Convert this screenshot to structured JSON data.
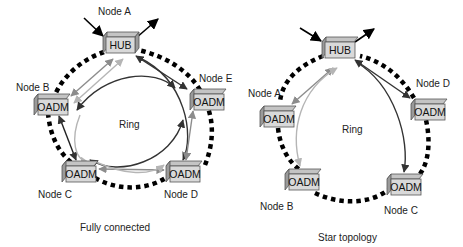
{
  "diagrams": [
    {
      "caption": "Fully connected",
      "ring_label": "Ring",
      "hub": {
        "box": "HUB",
        "node": "Node A"
      },
      "nodes": [
        {
          "id": "B",
          "label": "Node B",
          "box": "OADM"
        },
        {
          "id": "E",
          "label": "Node E",
          "box": "OADM"
        },
        {
          "id": "C",
          "label": "Node C",
          "box": "OADM"
        },
        {
          "id": "D",
          "label": "Node D",
          "box": "OADM"
        }
      ]
    },
    {
      "caption": "Star topology",
      "ring_label": "Ring",
      "hub": {
        "box": "HUB"
      },
      "nodes": [
        {
          "id": "A",
          "label": "Node A",
          "box": "OADM"
        },
        {
          "id": "D",
          "label": "Node D",
          "box": "OADM"
        },
        {
          "id": "B",
          "label": "Node B",
          "box": "OADM"
        },
        {
          "id": "C",
          "label": "Node C",
          "box": "OADM"
        }
      ]
    }
  ],
  "colors": {
    "ring_dots": "#000000",
    "box_face": "#d9d9d9",
    "box_top": "#c4c4c4",
    "box_side": "#9a9a9a",
    "arrow_dark": "#333333",
    "arrow_mid": "#8c8c8c",
    "arrow_light": "#b5b5b5"
  }
}
